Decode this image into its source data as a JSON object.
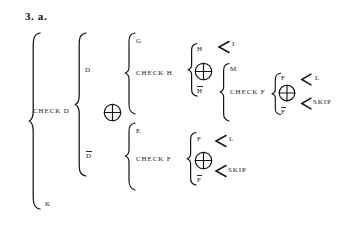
{
  "document": {
    "title": "3. a.",
    "type": "bracket-tree-diagram",
    "background_color": "#fefefe",
    "ink_color": "#141414"
  },
  "operators": {
    "circle_plus": "oplus-symbol",
    "brace": "curly-brace",
    "angle": "angle-bracket-arrow"
  },
  "nodes": {
    "level1": {
      "brace_label": "CHECK D",
      "top_label": "",
      "bottom_label": "K"
    },
    "level2": {
      "top_label": "D",
      "bottom_label": "D",
      "bottom_label_overbar": true,
      "operator": "oplus-symbol"
    },
    "level3_top": {
      "top_label": "G",
      "brace_label": "CHECK H"
    },
    "level3_bottom": {
      "top_label": "E",
      "brace_label": "CHECK F"
    },
    "level4_h": {
      "top_label": "H",
      "bottom_label": "H",
      "bottom_label_overbar": true,
      "operator": "oplus-symbol",
      "top_branch_label": "I",
      "bottom_branch_label": "M"
    },
    "level4_f_bottom": {
      "top_label": "F",
      "bottom_label": "F",
      "bottom_label_overbar": true,
      "operator": "oplus-symbol",
      "top_branch_label": "L",
      "bottom_branch_label": "SKIP"
    },
    "level5": {
      "brace_label": "CHECK F",
      "top_label": "F",
      "bottom_label": "F",
      "bottom_label_overbar": true,
      "operator": "oplus-symbol",
      "top_branch_label": "L",
      "bottom_branch_label": "SKIP"
    }
  }
}
